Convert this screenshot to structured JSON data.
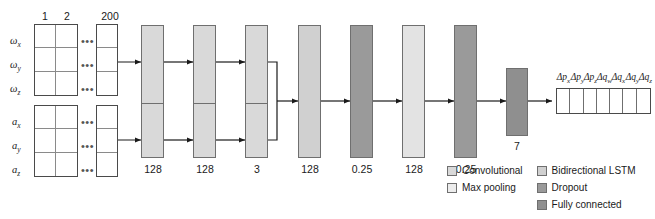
{
  "diagram": {
    "type": "neural-network-architecture",
    "title": "",
    "colors": {
      "convolutional": "#d9d9d9",
      "max_pooling": "#ececec",
      "bidirectional_lstm": "#d0d0d0",
      "dropout": "#9a9a9a",
      "fully_connected": "#8f8f8f",
      "outline": "#6f6f6f",
      "table_outline": "#4a4a4a",
      "text": "#1a1a1a"
    }
  },
  "input": {
    "column_headers": [
      "1",
      "2",
      "200"
    ],
    "ellipsis": "•••",
    "gyro_rows": [
      {
        "symbol": "ω",
        "sub": "x"
      },
      {
        "symbol": "ω",
        "sub": "y"
      },
      {
        "symbol": "ω",
        "sub": "z"
      }
    ],
    "accel_rows": [
      {
        "symbol": "a",
        "sub": "x"
      },
      {
        "symbol": "a",
        "sub": "y"
      },
      {
        "symbol": "a",
        "sub": "z"
      }
    ]
  },
  "branches": {
    "gyro": [
      {
        "label": "128",
        "kind": "convolutional"
      },
      {
        "label": "128",
        "kind": "convolutional"
      },
      {
        "label": "3",
        "kind": "max_pooling"
      }
    ],
    "accel": [
      {
        "label": "128",
        "kind": "convolutional"
      },
      {
        "label": "128",
        "kind": "convolutional"
      },
      {
        "label": "3",
        "kind": "max_pooling"
      }
    ]
  },
  "branch_labels": [
    "128",
    "128",
    "3"
  ],
  "merged_layers": [
    {
      "label": "128",
      "kind": "bidirectional_lstm"
    },
    {
      "label": "0.25",
      "kind": "dropout"
    },
    {
      "label": "128",
      "kind": "bidirectional_lstm"
    },
    {
      "label": "0.25",
      "kind": "dropout"
    }
  ],
  "output_layer": {
    "label": "7",
    "kind": "fully_connected"
  },
  "output_vector": {
    "labels": [
      {
        "d": "Δ",
        "base": "p",
        "sub": "x"
      },
      {
        "d": "Δ",
        "base": "p",
        "sub": "y"
      },
      {
        "d": "Δ",
        "base": "p",
        "sub": "z"
      },
      {
        "d": "Δ",
        "base": "q",
        "sub": "w"
      },
      {
        "d": "Δ",
        "base": "q",
        "sub": "x"
      },
      {
        "d": "Δ",
        "base": "q",
        "sub": "y"
      },
      {
        "d": "Δ",
        "base": "q",
        "sub": "z"
      }
    ]
  },
  "legend": {
    "left": [
      {
        "label": "Convolutional",
        "kind": "convolutional"
      },
      {
        "label": "Max pooling",
        "kind": "max_pooling"
      }
    ],
    "right": [
      {
        "label": "Bidirectional LSTM",
        "kind": "bidirectional_lstm"
      },
      {
        "label": "Dropout",
        "kind": "dropout"
      },
      {
        "label": "Fully connected",
        "kind": "fully_connected"
      }
    ]
  }
}
